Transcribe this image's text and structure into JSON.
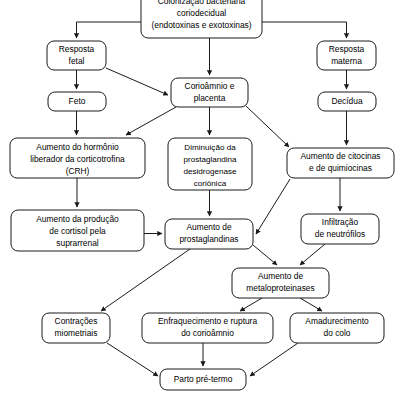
{
  "diagram": {
    "type": "flowchart",
    "orientation": "top-down",
    "colors": {
      "box_fill": "#ffffff",
      "box_stroke": "#1a1a1a",
      "text": "#000000",
      "background": "#ffffff"
    },
    "nodes": [
      {
        "id": "colonizacao",
        "lines": [
          "Colonização bacteriana",
          "coriodecidual",
          "(endotoxinas e exotoxinas)"
        ],
        "x": 141,
        "y": 0,
        "w": 121,
        "h": 38
      },
      {
        "id": "resposta-fetal",
        "lines": [
          "Resposta",
          "fetal"
        ],
        "x": 47,
        "y": 41,
        "w": 59,
        "h": 29
      },
      {
        "id": "resposta-materna",
        "lines": [
          "Resposta",
          "materna"
        ],
        "x": 317,
        "y": 41,
        "w": 59,
        "h": 29
      },
      {
        "id": "corioamnio-placenta",
        "lines": [
          "Corioâmnio e",
          "placenta"
        ],
        "x": 171,
        "y": 78,
        "w": 77,
        "h": 29
      },
      {
        "id": "feto",
        "lines": [
          "Feto"
        ],
        "x": 48,
        "y": 92,
        "w": 58,
        "h": 19
      },
      {
        "id": "decidua",
        "lines": [
          "Decídua"
        ],
        "x": 318,
        "y": 92,
        "w": 58,
        "h": 19
      },
      {
        "id": "crh",
        "lines": [
          "Aumento do hormônio",
          "liberador da corticotrofina",
          "(CRH)"
        ],
        "x": 10,
        "y": 138,
        "w": 135,
        "h": 40
      },
      {
        "id": "prostaglandina-desidrogenase",
        "lines": [
          "Diminuição da",
          "prostaglandina",
          "desidrogenase",
          "coriônica"
        ],
        "x": 168,
        "y": 138,
        "w": 84,
        "h": 52
      },
      {
        "id": "citocinas",
        "lines": [
          "Aumento de citocinas",
          "e de quimiocinas"
        ],
        "x": 287,
        "y": 148,
        "w": 107,
        "h": 30
      },
      {
        "id": "cortisol",
        "lines": [
          "Aumento da produção",
          "de cortisol pela",
          "suprarrenal"
        ],
        "x": 11,
        "y": 210,
        "w": 133,
        "h": 41
      },
      {
        "id": "prostaglandinas",
        "lines": [
          "Aumento de",
          "prostaglandinas"
        ],
        "x": 165,
        "y": 219,
        "w": 88,
        "h": 30
      },
      {
        "id": "neutrofilos",
        "lines": [
          "Infiltração",
          "de neutrófilos"
        ],
        "x": 301,
        "y": 214,
        "w": 78,
        "h": 30
      },
      {
        "id": "metaloproteinases",
        "lines": [
          "Aumento de",
          "metaloproteinases"
        ],
        "x": 232,
        "y": 268,
        "w": 97,
        "h": 30
      },
      {
        "id": "contracoes",
        "lines": [
          "Contrações",
          "miometriais"
        ],
        "x": 42,
        "y": 313,
        "w": 68,
        "h": 30
      },
      {
        "id": "enfraquecimento",
        "lines": [
          "Enfraquecimento e ruptura",
          "do corioâmnio"
        ],
        "x": 142,
        "y": 313,
        "w": 131,
        "h": 30
      },
      {
        "id": "amadurecimento",
        "lines": [
          "Amadurecimento",
          "do colo"
        ],
        "x": 290,
        "y": 313,
        "w": 94,
        "h": 30
      },
      {
        "id": "parto-pre-termo",
        "lines": [
          "Parto pré-termo"
        ],
        "x": 160,
        "y": 369,
        "w": 86,
        "h": 21
      }
    ],
    "edges": [
      {
        "from": "colonizacao",
        "to": "resposta-fetal",
        "kind": "orthogonal-left"
      },
      {
        "from": "colonizacao",
        "to": "corioamnio-placenta",
        "kind": "vertical"
      },
      {
        "from": "colonizacao",
        "to": "resposta-materna",
        "kind": "orthogonal-right"
      },
      {
        "from": "resposta-fetal",
        "to": "feto",
        "kind": "vertical"
      },
      {
        "from": "resposta-fetal",
        "to": "corioamnio-placenta",
        "kind": "diagonal"
      },
      {
        "from": "resposta-materna",
        "to": "decidua",
        "kind": "vertical"
      },
      {
        "from": "feto",
        "to": "crh",
        "kind": "vertical"
      },
      {
        "from": "corioamnio-placenta",
        "to": "crh",
        "kind": "diagonal"
      },
      {
        "from": "corioamnio-placenta",
        "to": "prostaglandina-desidrogenase",
        "kind": "vertical"
      },
      {
        "from": "corioamnio-placenta",
        "to": "citocinas",
        "kind": "diagonal"
      },
      {
        "from": "decidua",
        "to": "citocinas",
        "kind": "vertical"
      },
      {
        "from": "crh",
        "to": "cortisol",
        "kind": "vertical"
      },
      {
        "from": "prostaglandina-desidrogenase",
        "to": "prostaglandinas",
        "kind": "vertical"
      },
      {
        "from": "cortisol",
        "to": "prostaglandinas",
        "kind": "horizontal"
      },
      {
        "from": "citocinas",
        "to": "prostaglandinas",
        "kind": "diagonal"
      },
      {
        "from": "citocinas",
        "to": "neutrofilos",
        "kind": "vertical"
      },
      {
        "from": "neutrofilos",
        "to": "metaloproteinases",
        "kind": "diagonal"
      },
      {
        "from": "prostaglandinas",
        "to": "metaloproteinases",
        "kind": "diagonal"
      },
      {
        "from": "prostaglandinas",
        "to": "contracoes",
        "kind": "diagonal"
      },
      {
        "from": "metaloproteinases",
        "to": "enfraquecimento",
        "kind": "diagonal"
      },
      {
        "from": "metaloproteinases",
        "to": "amadurecimento",
        "kind": "diagonal"
      },
      {
        "from": "contracoes",
        "to": "parto-pre-termo",
        "kind": "diagonal"
      },
      {
        "from": "enfraquecimento",
        "to": "parto-pre-termo",
        "kind": "vertical"
      },
      {
        "from": "amadurecimento",
        "to": "parto-pre-termo",
        "kind": "diagonal"
      }
    ]
  }
}
